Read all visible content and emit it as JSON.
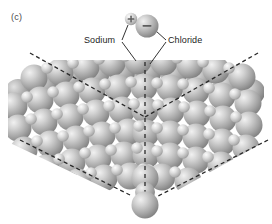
{
  "figure": {
    "panel_label": "(c)",
    "kind": "space-filling-crystal-lattice-illustration",
    "background_color": "#ffffff",
    "sphere_color": "#a8a8a8",
    "sphere_highlight_color": "#e8e8e8",
    "sphere_shadow_color": "#6f6f6f",
    "outline_color": "#1a1a1a"
  },
  "labels": {
    "sodium": "Sodium",
    "chloride": "Chloride"
  },
  "callouts": [
    {
      "name": "sodium",
      "text": "Sodium",
      "ion_charge": "+",
      "ion_relative_size": "small",
      "targets": [
        "free-sodium-ion",
        "lattice-sodium-ion"
      ]
    },
    {
      "name": "chloride",
      "text": "Chloride",
      "ion_charge": "−",
      "ion_relative_size": "large",
      "targets": [
        "free-chloride-ion",
        "lattice-chloride-ion"
      ]
    }
  ],
  "free_ions": [
    {
      "name": "free-sodium-ion",
      "charge": "+",
      "cx": 131,
      "cy": 19,
      "r": 6.2
    },
    {
      "name": "free-chloride-ion",
      "charge": "−",
      "cx": 147,
      "cy": 26,
      "r": 11.5
    },
    {
      "name": "detached-bottom-ion",
      "charge": "",
      "cx": 145,
      "cy": 205,
      "r": 13.5
    }
  ],
  "guides": {
    "style": "dashed",
    "color": "#2a2a2a",
    "dash_pattern": "4 3",
    "lines": [
      {
        "name": "guide-upper-left-edge",
        "x1": 30,
        "y1": 53,
        "x2": 145,
        "y2": 117
      },
      {
        "name": "guide-upper-right-edge",
        "x1": 258,
        "y1": 53,
        "x2": 145,
        "y2": 117
      },
      {
        "name": "guide-vertical-axis",
        "x1": 145,
        "y1": 60,
        "x2": 145,
        "y2": 205
      },
      {
        "name": "guide-lower-left-edge",
        "x1": 20,
        "y1": 140,
        "x2": 130,
        "y2": 196
      },
      {
        "name": "guide-lower-right-edge",
        "x1": 268,
        "y1": 140,
        "x2": 160,
        "y2": 196
      }
    ]
  },
  "lattice": {
    "rows": 7,
    "description": "face-centred cubic packing of large chloride and small sodium spheres forming an inverted pyramid corner"
  }
}
